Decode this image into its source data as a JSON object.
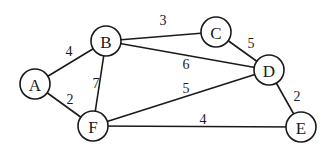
{
  "graph": {
    "nodes": [
      {
        "id": "A",
        "label": "A"
      },
      {
        "id": "B",
        "label": "B"
      },
      {
        "id": "C",
        "label": "C"
      },
      {
        "id": "D",
        "label": "D"
      },
      {
        "id": "E",
        "label": "E"
      },
      {
        "id": "F",
        "label": "F"
      }
    ],
    "edges": [
      {
        "from": "A",
        "to": "B",
        "weight": "4"
      },
      {
        "from": "A",
        "to": "F",
        "weight": "2"
      },
      {
        "from": "B",
        "to": "C",
        "weight": "3"
      },
      {
        "from": "B",
        "to": "D",
        "weight": "6"
      },
      {
        "from": "B",
        "to": "F",
        "weight": "7"
      },
      {
        "from": "C",
        "to": "D",
        "weight": "5"
      },
      {
        "from": "F",
        "to": "D",
        "weight": "5"
      },
      {
        "from": "D",
        "to": "E",
        "weight": "2"
      },
      {
        "from": "F",
        "to": "E",
        "weight": "4"
      }
    ]
  }
}
